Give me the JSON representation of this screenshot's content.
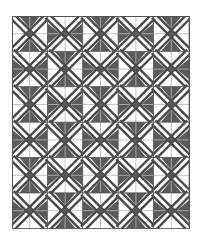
{
  "quilt": {
    "name": "diagonal-x-block-quilt",
    "rows": 6,
    "cols": 5,
    "block_size": 35.4,
    "origin": [
      12,
      16
    ],
    "colors": {
      "background": "#ffffff",
      "stripe": "#4a4a4a",
      "triangle": "#5a5a5a",
      "grid": "#b8b8b8",
      "border": "#555555"
    },
    "rule": "vertical-triangles when (row+col) is even, horizontal when odd"
  }
}
